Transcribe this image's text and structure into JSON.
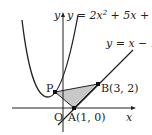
{
  "diagram": {
    "curve_label": "y = 2x² + 5x + 4",
    "curve_label_parts": {
      "pre": "y = 2x",
      "sup": "2",
      "post": " + 5x + 4"
    },
    "line_label": "y = x − 1",
    "axis_x_label": "x",
    "axis_y_label": "y",
    "origin_label": "O",
    "points": [
      {
        "name": "P",
        "label": "P"
      },
      {
        "name": "A",
        "label": "A(1, 0)"
      },
      {
        "name": "B",
        "label": "B(3, 2)"
      }
    ],
    "colors": {
      "stroke": "#222222",
      "shade": "#c8c8c8"
    }
  }
}
